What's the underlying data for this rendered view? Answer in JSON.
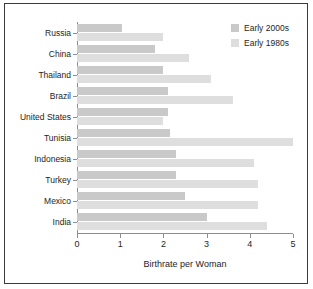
{
  "chart_data": {
    "type": "bar",
    "orientation": "horizontal",
    "title": "",
    "xlabel": "Birthrate per Woman",
    "ylabel": "",
    "xlim": [
      0,
      5
    ],
    "xticks": [
      "0",
      "1",
      "2",
      "3",
      "4",
      "5"
    ],
    "grid": false,
    "legend_position": "top-right",
    "categories": [
      "Russia",
      "China",
      "Thailand",
      "Brazil",
      "United States",
      "Tunisia",
      "Indonesia",
      "Turkey",
      "Mexico",
      "India"
    ],
    "series": [
      {
        "name": "Early 2000s",
        "color": "#c9c9c9",
        "values": [
          1.05,
          1.8,
          2.0,
          2.1,
          2.1,
          2.15,
          2.3,
          2.3,
          2.5,
          3.0
        ]
      },
      {
        "name": "Early 1980s",
        "color": "#dedede",
        "values": [
          2.0,
          2.6,
          3.1,
          3.6,
          2.0,
          5.0,
          4.1,
          4.2,
          4.2,
          4.4
        ]
      }
    ]
  },
  "legend": {
    "items": [
      {
        "label": "Early 2000s",
        "color": "#c9c9c9"
      },
      {
        "label": "Early 1980s",
        "color": "#dedede"
      }
    ]
  },
  "axis": {
    "x_title": "Birthrate per Woman"
  }
}
